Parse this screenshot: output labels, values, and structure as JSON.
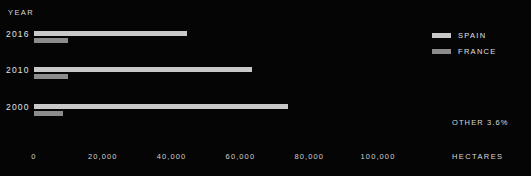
{
  "chart_data": {
    "type": "bar",
    "orientation": "horizontal",
    "title": "",
    "xlabel": "HECTARES",
    "ylabel": "YEAR",
    "categories": [
      "2016",
      "2010",
      "2000"
    ],
    "series": [
      {
        "name": "SPAIN",
        "color": "#c9c9c9",
        "values": [
          44600,
          63500,
          73700
        ]
      },
      {
        "name": "FRANCE",
        "color": "#8c8c8c",
        "values": [
          9900,
          9900,
          8400
        ]
      }
    ],
    "xlim": [
      0,
      120000
    ],
    "xticks": [
      0,
      20000,
      40000,
      60000,
      80000,
      100000
    ],
    "xtick_labels": [
      "0",
      "20,000",
      "40,000",
      "60,000",
      "80,000",
      "100,000"
    ],
    "grid": false,
    "legend_position": "top-right",
    "annotations": [
      "OTHER 3.6%"
    ],
    "background_color": "#050505",
    "text_color": "#e0e0e0"
  },
  "axes": {
    "year_title": "YEAR",
    "hectares_title": "HECTARES"
  },
  "note": {
    "other_label": "OTHER 3.6%"
  }
}
